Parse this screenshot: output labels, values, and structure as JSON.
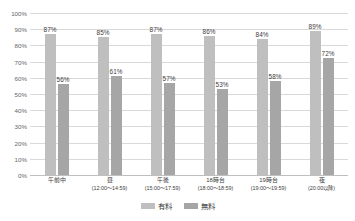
{
  "chart_data": {
    "type": "bar",
    "title": "",
    "xlabel": "",
    "ylabel": "",
    "ylim": [
      0,
      100
    ],
    "ytick_labels": [
      "100%",
      "90%",
      "80%",
      "70%",
      "60%",
      "50%",
      "40%",
      "30%",
      "20%",
      "10%",
      "0%"
    ],
    "ytick_values": [
      100,
      90,
      80,
      70,
      60,
      50,
      40,
      30,
      20,
      10,
      0
    ],
    "grid": true,
    "legend_position": "bottom-center",
    "value_suffix": "%",
    "categories": [
      {
        "line1": "午前中",
        "line2": ""
      },
      {
        "line1": "昼",
        "line2": "(12:00〜14:59)"
      },
      {
        "line1": "午後",
        "line2": "(15:00〜17:59)"
      },
      {
        "line1": "18時台",
        "line2": "(18:00〜18:59)"
      },
      {
        "line1": "19時台",
        "line2": "(19:00〜19:59)"
      },
      {
        "line1": "夜",
        "line2": "(20:00以降)"
      }
    ],
    "series": [
      {
        "name": "有料",
        "color": "#bfbfbf",
        "values": [
          87,
          85,
          87,
          86,
          84,
          89
        ],
        "labels": [
          "87%",
          "85%",
          "87%",
          "86%",
          "84%",
          "89%"
        ]
      },
      {
        "name": "無料",
        "color": "#a6a6a6",
        "values": [
          56,
          61,
          57,
          53,
          58,
          72
        ],
        "labels": [
          "56%",
          "61%",
          "57%",
          "53%",
          "58%",
          "72%"
        ]
      }
    ]
  }
}
